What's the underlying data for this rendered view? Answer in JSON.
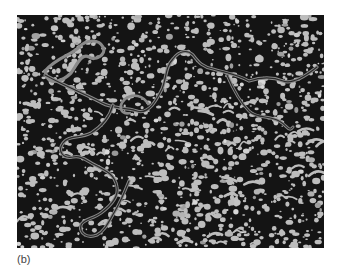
{
  "figure": {
    "panel_label": "(b)",
    "image_description": "Grayscale electron micrograph showing a long winding filamentous strand (appearing as a doubled, ribbon-like loop) crossing a speckled background of light granular particles on a dark field",
    "colors": {
      "background": "#141414",
      "particles": "#bdbdbd",
      "strand_outer": "#8a8a8a",
      "strand_inner": "#2a2a2a",
      "page": "#ffffff"
    }
  }
}
